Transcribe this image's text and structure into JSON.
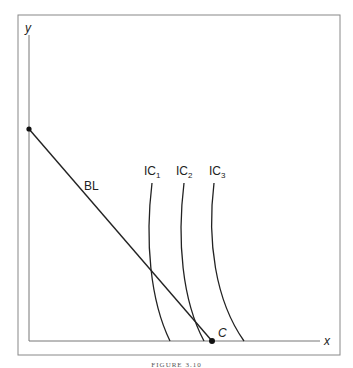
{
  "axes": {
    "x_label": "x",
    "y_label": "y"
  },
  "budget_line": {
    "label": "BL",
    "intercept_point": "y-intercept dot",
    "end_point_label": "C"
  },
  "indifference_curves": [
    {
      "label": "IC",
      "sub": "1"
    },
    {
      "label": "IC",
      "sub": "2"
    },
    {
      "label": "IC",
      "sub": "3"
    }
  ],
  "caption": "FIGURE 3.10",
  "colors": {
    "line": "#222222",
    "frame": "#888888"
  }
}
